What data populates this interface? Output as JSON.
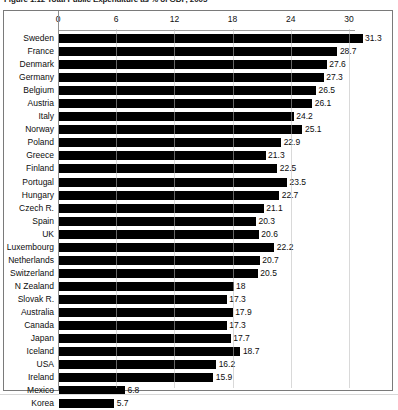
{
  "figure": {
    "title": "Figure 1.12 Total Public Expenditure as % of GDP, 2005"
  },
  "chart_data": {
    "type": "bar",
    "orientation": "horizontal",
    "title": "Figure 1.12 Total Public Expenditure as % of GDP, 2005",
    "xlabel": "",
    "ylabel": "",
    "xlim": [
      0,
      33
    ],
    "xticks": [
      0,
      6,
      12,
      18,
      24,
      30
    ],
    "xtick_labels": [
      "0",
      "6",
      "12",
      "18",
      "24",
      "30"
    ],
    "grid": true,
    "grid_axis": "x",
    "legend": false,
    "value_labels": true,
    "bar_color": "#000000",
    "categories": [
      "Sweden",
      "France",
      "Denmark",
      "Germany",
      "Belgium",
      "Austria",
      "Italy",
      "Norway",
      "Poland",
      "Greece",
      "Finland",
      "Portugal",
      "Hungary",
      "Czech R.",
      "Spain",
      "UK",
      "Luxembourg",
      "Netherlands",
      "Switzerland",
      "N Zealand",
      "Slovak R.",
      "Australia",
      "Canada",
      "Japan",
      "Iceland",
      "USA",
      "Ireland",
      "Mexico",
      "Korea"
    ],
    "values": [
      31.3,
      28.7,
      27.6,
      27.3,
      26.5,
      26.1,
      24.2,
      25.1,
      22.9,
      21.3,
      22.5,
      23.5,
      22.7,
      21.1,
      20.3,
      20.6,
      22.2,
      20.7,
      20.5,
      18,
      17.3,
      17.9,
      17.3,
      17.7,
      18.7,
      16.2,
      15.9,
      6.8,
      5.7
    ],
    "value_labels_text": [
      "31.3",
      "28.7",
      "27.6",
      "27.3",
      "26.5",
      "26.1",
      "24.2",
      "25.1",
      "22.9",
      "21.3",
      "22.5",
      "23.5",
      "22.7",
      "21.1",
      "20.3",
      "20.6",
      "22.2",
      "20.7",
      "20.5",
      "18",
      "17.3",
      "17.9",
      "17.3",
      "17.7",
      "18.7",
      "16.2",
      "15.9",
      "6.8",
      "5.7"
    ]
  }
}
